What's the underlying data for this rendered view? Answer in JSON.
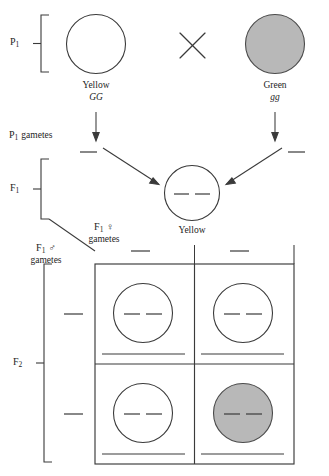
{
  "figure": {
    "background_color": "#ffffff",
    "line_color": "#3a3a3a",
    "shaded_fill": "#b8b8b8",
    "width": 329,
    "height": 476,
    "faint_top_text": ""
  },
  "generations": {
    "p1": "P",
    "p1_sub": "1",
    "p1_gametes": "P",
    "p1_gametes_sub": "1",
    "p1_gametes_word": "gametes",
    "f1": "F",
    "f1_sub": "1",
    "f2": "F",
    "f2_sub": "2"
  },
  "parents": {
    "left": {
      "phenotype": "Yellow",
      "genotype": "GG",
      "shaded": false
    },
    "cross_symbol": "×",
    "right": {
      "phenotype": "Green",
      "genotype": "gg",
      "shaded": true
    }
  },
  "f1_offspring": {
    "phenotype": "Yellow",
    "genotype_blank_count": 2
  },
  "gamete_labels": {
    "female": {
      "gen": "F",
      "sub": "1",
      "symbol": "♀",
      "word": "gametes"
    },
    "male": {
      "gen": "F",
      "sub": "1",
      "symbol": "♂",
      "word": "gametes"
    }
  },
  "punnett": {
    "columns": 2,
    "rows": 2,
    "column_headers": [
      "",
      ""
    ],
    "row_headers": [
      "",
      ""
    ],
    "cells": [
      {
        "row": 0,
        "col": 0,
        "shaded": false,
        "genotype_blanks": 2,
        "phenotype_blank": true
      },
      {
        "row": 0,
        "col": 1,
        "shaded": false,
        "genotype_blanks": 2,
        "phenotype_blank": true
      },
      {
        "row": 1,
        "col": 0,
        "shaded": false,
        "genotype_blanks": 2,
        "phenotype_blank": true
      },
      {
        "row": 1,
        "col": 1,
        "shaded": true,
        "genotype_blanks": 2,
        "phenotype_blank": true
      }
    ]
  }
}
